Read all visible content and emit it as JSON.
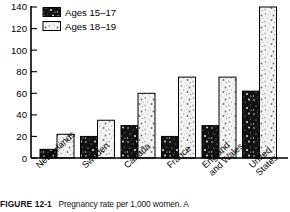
{
  "chart_data": {
    "type": "bar",
    "title": "",
    "xlabel": "",
    "ylabel": "",
    "ylim": [
      0,
      140
    ],
    "ytick_step": 20,
    "yticks": [
      0,
      20,
      40,
      60,
      80,
      100,
      120,
      140
    ],
    "grid": false,
    "legend_position": "top-left",
    "categories": [
      "Netherlands",
      "Sweden",
      "Canada",
      "France",
      "England and Wales",
      "United States"
    ],
    "series": [
      {
        "name": "Ages 15–17",
        "fill": "dark-speckle",
        "color": "#1a1a1a",
        "values": [
          8,
          20,
          30,
          20,
          30,
          62
        ]
      },
      {
        "name": "Ages 18–19",
        "fill": "light-speckle",
        "color": "#e8e8e8",
        "values": [
          22,
          35,
          60,
          75,
          75,
          140
        ]
      }
    ]
  },
  "legend": {
    "items": [
      {
        "label": "Ages 15–17",
        "swatch": "dark-speckle"
      },
      {
        "label": "Ages 18–19",
        "swatch": "light-speckle"
      }
    ]
  },
  "axis": {
    "y_tick_labels": [
      "140",
      "120",
      "100",
      "80",
      "60",
      "40",
      "20",
      "0"
    ]
  },
  "xaxis": {
    "labels": [
      {
        "line1": "Netherlands",
        "line2": ""
      },
      {
        "line1": "Sweden",
        "line2": ""
      },
      {
        "line1": "Canada",
        "line2": ""
      },
      {
        "line1": "France",
        "line2": ""
      },
      {
        "line1": "England",
        "line2": "and Wales"
      },
      {
        "line1": "United",
        "line2": "States"
      }
    ]
  },
  "caption": {
    "figure_number": "FIGURE 12-1",
    "text": "Pregnancy rate per 1,000 women.  A"
  },
  "colors": {
    "ink": "#000000",
    "paper": "#ffffff",
    "dark_bar": "#1a1a1a",
    "light_bar": "#ededed"
  }
}
